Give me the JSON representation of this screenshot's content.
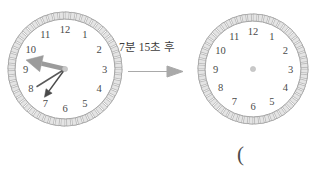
{
  "page": {
    "width": 311,
    "height": 172,
    "background": "#ffffff"
  },
  "transition": {
    "label": "7분 15초 후",
    "arrow_icon": "right-arrow-icon",
    "arrow_color": "#a8a8a8"
  },
  "answer_blank": {
    "text": "("
  },
  "colors": {
    "bezel_stroke": "#9a9a9a",
    "bezel_fill": "#e4e4e4",
    "numeral": "#4a4a4a",
    "minute_hand": "#999999",
    "hour_hand": "#5a5a5a",
    "second_hand": "#4a4a4a",
    "hub": "#c9c9c9"
  },
  "clocks": [
    {
      "id": "clock-before",
      "name": "analog-clock-before",
      "cx": 65,
      "cy": 69,
      "radius": 57,
      "numerals": [
        "12",
        "1",
        "2",
        "3",
        "4",
        "5",
        "6",
        "7",
        "8",
        "9",
        "10",
        "11"
      ],
      "tick_count": 60,
      "has_hands": true,
      "time": {
        "hour": 7,
        "minute": 47,
        "second": 36,
        "display": "7:47:36"
      },
      "hands": [
        {
          "name": "minute-hand",
          "angle_deg": 283,
          "length": 40,
          "width": 4.6,
          "color": "#9b9b9b",
          "arrowhead": true
        },
        {
          "name": "hour-hand",
          "angle_deg": 238,
          "length": 33,
          "width": 1.5,
          "color": "#5a5a5a",
          "arrowhead": false
        },
        {
          "name": "second-hand",
          "angle_deg": 216,
          "length": 35,
          "width": 1.5,
          "color": "#4a4a4a",
          "arrowhead": true
        }
      ]
    },
    {
      "id": "clock-after",
      "name": "analog-clock-after",
      "cx": 253,
      "cy": 69,
      "radius": 55,
      "numerals": [
        "12",
        "1",
        "2",
        "3",
        "4",
        "5",
        "6",
        "7",
        "8",
        "9",
        "10",
        "11"
      ],
      "tick_count": 60,
      "has_hands": false,
      "time": {
        "hour": null,
        "minute": null,
        "second": null,
        "display": ""
      },
      "hands": []
    }
  ]
}
